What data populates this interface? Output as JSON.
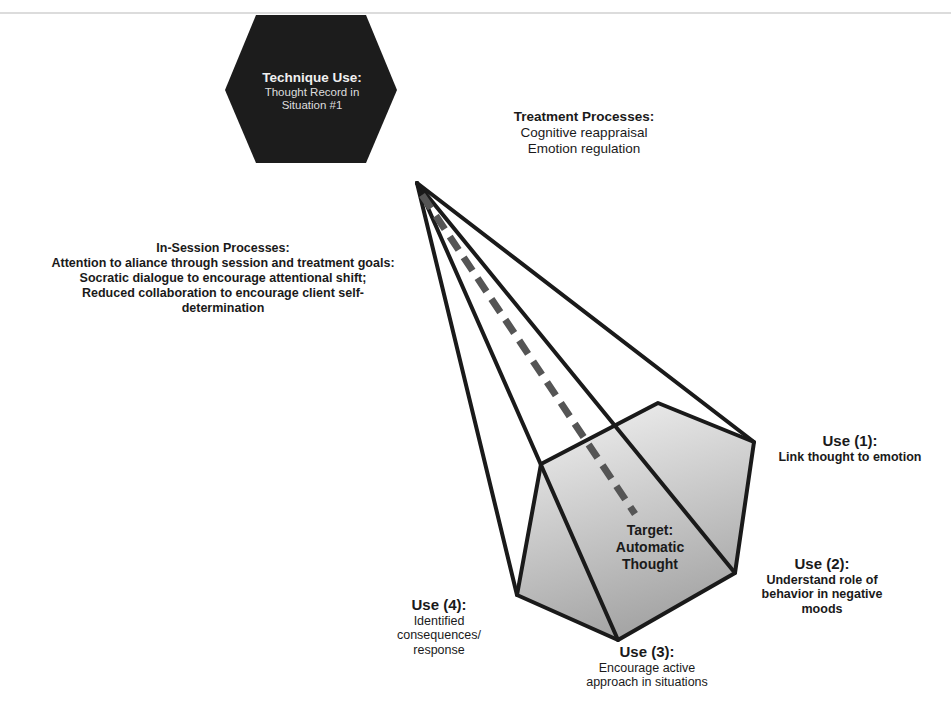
{
  "technique": {
    "title": "Technique Use:",
    "lines": [
      "Thought Record in",
      "Situation #1"
    ]
  },
  "treatment_processes": {
    "title": "Treatment Processes:",
    "lines": [
      "Cognitive reappraisal",
      "Emotion regulation"
    ]
  },
  "in_session_processes": {
    "title": "In-Session Processes:",
    "lines": [
      "Attention to aliance through session and treatment goals:",
      "Socratic dialogue to encourage attentional shift;",
      "Reduced collaboration to encourage client self-",
      "determination"
    ]
  },
  "target": {
    "lines": [
      "Target:",
      "Automatic",
      "Thought"
    ]
  },
  "uses": [
    {
      "title": "Use (1):",
      "lines": [
        "Link thought to emotion"
      ]
    },
    {
      "title": "Use (2):",
      "lines": [
        "Understand role of",
        "behavior in negative",
        "moods"
      ]
    },
    {
      "title": "Use (3):",
      "lines": [
        "Encourage active",
        "approach in situations"
      ]
    },
    {
      "title": "Use (4):",
      "lines": [
        "Identified",
        "consequences/",
        "response"
      ]
    }
  ],
  "colors": {
    "hexagon": "#1c1c1c",
    "stroke": "#1a1a1a",
    "dashed": "#555555",
    "pentagon_fill_top": "#f2f2f2",
    "pentagon_fill_bottom": "#a9a9a9"
  }
}
